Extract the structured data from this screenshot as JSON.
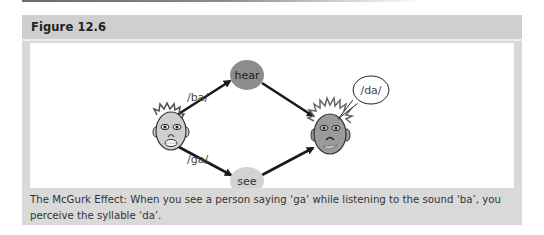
{
  "figure": {
    "title": "Figure 12.6",
    "caption": "The McGurk Effect: When you see a person saying ‘ga’ while listening to the sound ‘ba’, you perceive the syllable ‘da’."
  },
  "diagram": {
    "nodes": {
      "hear": {
        "label": "hear",
        "color": "#8c8c8c"
      },
      "see": {
        "label": "see",
        "color": "#cfcfcf"
      }
    },
    "edge_labels": {
      "upper": "/ba/",
      "lower": "/ga/"
    },
    "speech_bubble": "/da/",
    "speaker_face": {
      "skin": "#cfcfcf",
      "hair": "#555555"
    },
    "listener_face": {
      "skin": "#9a9a9a",
      "hair": "#666666"
    }
  }
}
